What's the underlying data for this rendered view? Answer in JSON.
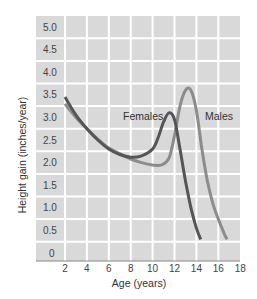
{
  "chart_data": {
    "type": "line",
    "title": "",
    "xlabel": "Age (years)",
    "ylabel": "Height gain (inches/year)",
    "xlim": [
      2,
      18
    ],
    "ylim": [
      0,
      5.0
    ],
    "x_ticks": [
      "2",
      "4",
      "6",
      "8",
      "10",
      "12",
      "14",
      "16",
      "18"
    ],
    "y_ticks": [
      "0",
      "0.5",
      "1.0",
      "1.5",
      "2.0",
      "2.5",
      "3.0",
      "3.5",
      "4.0",
      "4.5",
      "5.0"
    ],
    "grid": true,
    "legend": "inline labels",
    "series": [
      {
        "name": "Females",
        "color": "#555555",
        "x": [
          2,
          3,
          4,
          5,
          6,
          7,
          8,
          9,
          10,
          10.5,
          11,
          11.5,
          12,
          12.5,
          13,
          13.5,
          14,
          14.4
        ],
        "values": [
          3.45,
          3.05,
          2.75,
          2.5,
          2.3,
          2.18,
          2.12,
          2.15,
          2.3,
          2.55,
          2.9,
          3.1,
          2.95,
          2.3,
          1.6,
          1.0,
          0.55,
          0.3
        ]
      },
      {
        "name": "Males",
        "color": "#888888",
        "x": [
          2,
          3,
          4,
          5,
          6,
          7,
          8,
          9,
          10,
          10.8,
          11.5,
          12,
          12.5,
          13,
          13.5,
          14,
          14.5,
          15,
          15.5,
          16,
          16.5,
          16.8
        ],
        "values": [
          3.3,
          3.0,
          2.75,
          2.52,
          2.32,
          2.2,
          2.08,
          2.0,
          1.95,
          1.95,
          2.1,
          2.6,
          3.25,
          3.6,
          3.6,
          3.15,
          2.3,
          1.6,
          1.1,
          0.75,
          0.45,
          0.3
        ]
      }
    ],
    "annotations": [
      {
        "text": "Females",
        "x": 9.8,
        "y": 3.0
      },
      {
        "text": "Males",
        "x": 15.2,
        "y": 3.0
      }
    ]
  },
  "labels": {
    "xlabel": "Age (years)",
    "ylabel": "Height gain (inches/year)",
    "females": "Females",
    "males": "Males"
  },
  "colors": {
    "plot_bg": "#d9d9d9",
    "grid": "#ffffff",
    "axis": "#888888",
    "females": "#555555",
    "males": "#8c8c8c"
  }
}
